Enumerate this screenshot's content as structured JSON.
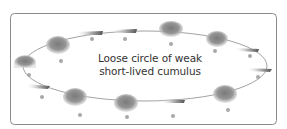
{
  "diagram": {
    "label_lines": [
      "Loose circle of weak",
      "short-lived  cumulus"
    ],
    "colors": {
      "border": "#8a8a8a",
      "ellipse": "#8a8a8a",
      "cloud": "#8c8c8c",
      "dot": "#a8a8a8",
      "text": "#333333",
      "background": "#ffffff"
    },
    "elements": {
      "cumulus_blobs": 7,
      "anvil_streaks": 6,
      "dots": 13
    }
  }
}
